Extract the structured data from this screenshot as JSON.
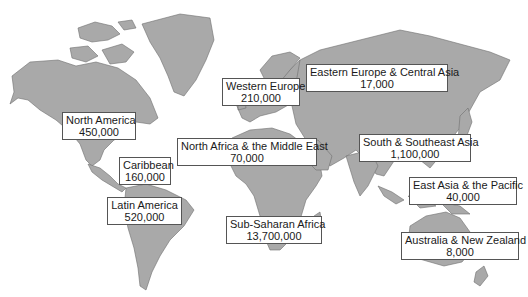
{
  "map": {
    "type": "world-map",
    "regions": [
      {
        "id": "north-america",
        "name": "North America",
        "value": "450,000"
      },
      {
        "id": "caribbean",
        "name": "Caribbean",
        "value": "160,000"
      },
      {
        "id": "latin-america",
        "name": "Latin America",
        "value": "520,000"
      },
      {
        "id": "western-europe",
        "name": "Western Europe",
        "value": "210,000"
      },
      {
        "id": "eastern-europe-central-asia",
        "name": "Eastern Europe & Central Asia",
        "value": "17,000"
      },
      {
        "id": "north-africa-middle-east",
        "name": "North Africa & the Middle East",
        "value": "70,000"
      },
      {
        "id": "sub-saharan-africa",
        "name": "Sub-Saharan Africa",
        "value": "13,700,000"
      },
      {
        "id": "south-southeast-asia",
        "name": "South & Southeast Asia",
        "value": "1,100,000"
      },
      {
        "id": "east-asia-pacific",
        "name": "East Asia & the Pacific",
        "value": "40,000"
      },
      {
        "id": "australia-new-zealand",
        "name": "Australia & New Zealand",
        "value": "8,000"
      }
    ],
    "colors": {
      "land": "#a9a9a9",
      "ocean": "#ffffff",
      "label_border": "#555555"
    }
  }
}
